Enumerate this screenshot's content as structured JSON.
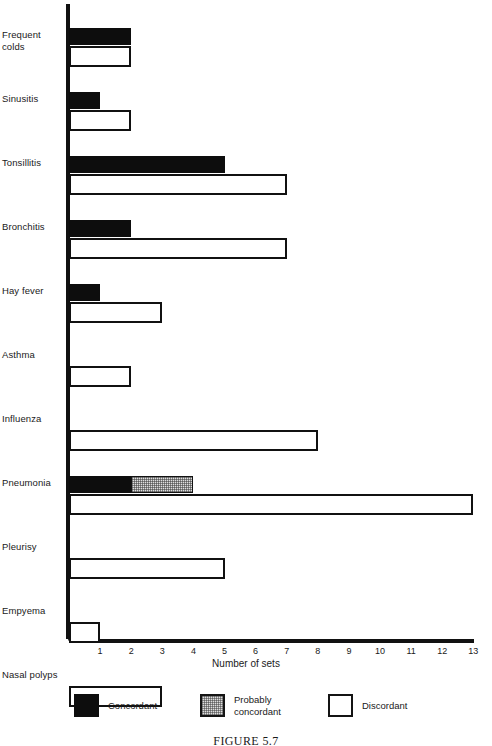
{
  "figure": {
    "caption": "FIGURE 5.7"
  },
  "axis": {
    "x_title": "Number of sets",
    "x_ticks": [
      1,
      2,
      3,
      4,
      5,
      6,
      7,
      8,
      9,
      10,
      11,
      12,
      13
    ]
  },
  "legend": {
    "items": [
      {
        "key": "concordant",
        "label": "Concordant",
        "color": "#0d0d0d"
      },
      {
        "key": "probable",
        "label": "Probably\nconcordant",
        "color": "#dedede"
      },
      {
        "key": "discordant",
        "label": "Discordant",
        "color": "#ffffff"
      }
    ]
  },
  "chart_data": {
    "type": "bar",
    "orientation": "horizontal",
    "title": "FIGURE 5.7",
    "xlabel": "Number of sets",
    "ylabel": "",
    "xlim": [
      0,
      13
    ],
    "grid": false,
    "legend_position": "bottom",
    "stacked": true,
    "categories": [
      "Frequent colds",
      "Sinusitis",
      "Tonsillitis",
      "Bronchitis",
      "Hay fever",
      "Asthma",
      "Influenza",
      "Pneumonia",
      "Pleurisy",
      "Empyema",
      "Nasal polyps"
    ],
    "series": [
      {
        "name": "Concordant",
        "values": [
          2,
          1,
          5,
          2,
          1,
          0,
          0,
          2,
          0,
          0,
          0
        ]
      },
      {
        "name": "Probably concordant",
        "values": [
          0,
          0,
          0,
          0,
          0,
          0,
          0,
          2,
          0,
          0,
          0
        ]
      },
      {
        "name": "Discordant",
        "values": [
          2,
          2,
          7,
          7,
          3,
          2,
          8,
          13,
          5,
          1,
          3
        ]
      }
    ]
  }
}
